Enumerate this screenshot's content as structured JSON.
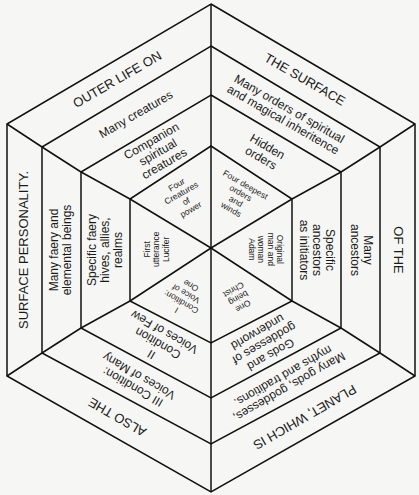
{
  "rings": [
    {
      "name": "outer-ring",
      "segments": [
        {
          "position": "top-left",
          "lines": [
            "OUTER LIFE ON"
          ]
        },
        {
          "position": "top-right",
          "lines": [
            "THE SURFACE"
          ]
        },
        {
          "position": "right",
          "lines": [
            "OF THE"
          ]
        },
        {
          "position": "bottom-right",
          "lines": [
            "PLANET, WHICH IS"
          ]
        },
        {
          "position": "bottom-left",
          "lines": [
            "ALSO THE"
          ]
        },
        {
          "position": "left",
          "lines": [
            "SURFACE PERSONALITY."
          ]
        }
      ]
    },
    {
      "name": "ring-2",
      "segments": [
        {
          "position": "top-left",
          "lines": [
            "Many creatures"
          ]
        },
        {
          "position": "top-right",
          "lines": [
            "Many orders of spiritual",
            "and magical inheritence"
          ]
        },
        {
          "position": "right",
          "lines": [
            "Many",
            "ancestors"
          ]
        },
        {
          "position": "bottom-right",
          "lines": [
            "Many gods, goddesses,",
            "myths and traditions."
          ]
        },
        {
          "position": "bottom-left",
          "lines": [
            "III Condition:",
            "Voices of Many"
          ]
        },
        {
          "position": "left",
          "lines": [
            "Many faery and",
            "elemental beings"
          ]
        }
      ]
    },
    {
      "name": "ring-3",
      "segments": [
        {
          "position": "top-left",
          "lines": [
            "Companion",
            "spiritual",
            "creatures"
          ]
        },
        {
          "position": "top-right",
          "lines": [
            "Hidden",
            "orders"
          ]
        },
        {
          "position": "right",
          "lines": [
            "Specific",
            "ancestors",
            "as initiators"
          ]
        },
        {
          "position": "bottom-right",
          "lines": [
            "Gods and",
            "goddesses of",
            "underworld"
          ]
        },
        {
          "position": "bottom-left",
          "lines": [
            "II",
            "Condition",
            "Voices of Few"
          ]
        },
        {
          "position": "left",
          "lines": [
            "Specific faery",
            "hives, allies,",
            "realms"
          ]
        }
      ]
    },
    {
      "name": "inner-ring",
      "segments": [
        {
          "position": "top-left",
          "lines": [
            "Four",
            "Creatures",
            "of",
            "power"
          ]
        },
        {
          "position": "top-right",
          "lines": [
            "Four deepest",
            "orders",
            "and",
            "winds"
          ]
        },
        {
          "position": "right",
          "lines": [
            "Original",
            "man and",
            "woman",
            "Adam"
          ]
        },
        {
          "position": "bottom-right",
          "lines": [
            "One",
            "being",
            "Christ"
          ]
        },
        {
          "position": "bottom-left",
          "lines": [
            "I",
            "Condition:",
            "Voice of",
            "One"
          ]
        },
        {
          "position": "left",
          "lines": [
            "First",
            "utterance",
            "Lucifer"
          ]
        }
      ]
    }
  ]
}
